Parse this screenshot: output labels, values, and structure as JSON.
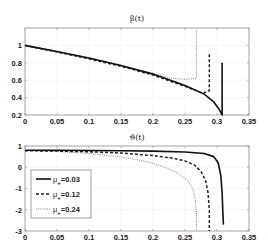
{
  "chart_data": [
    {
      "type": "line",
      "title": "β(t)",
      "xlabel": "",
      "ylabel": "",
      "xlim": [
        0,
        0.35
      ],
      "ylim": [
        0.2,
        1.2
      ],
      "xticks": [
        0,
        0.05,
        0.1,
        0.15,
        0.2,
        0.25,
        0.3,
        0.35
      ],
      "xtick_labels": [
        "0",
        "0.05",
        "0.1",
        "0.15",
        "0.2",
        "0.25",
        "0.3",
        "0.35"
      ],
      "yticks": [
        0.2,
        0.4,
        0.6,
        0.8,
        1
      ],
      "ytick_labels": [
        "0.2",
        "0.4",
        "0.6",
        "0.8",
        "1"
      ],
      "grid": true,
      "series": [
        {
          "name": "μ+=0.03",
          "style": "solid",
          "x": [
            0,
            0.05,
            0.1,
            0.15,
            0.2,
            0.25,
            0.28,
            0.295,
            0.303,
            0.308,
            0.308
          ],
          "y": [
            1.0,
            0.93,
            0.855,
            0.77,
            0.67,
            0.54,
            0.44,
            0.35,
            0.27,
            0.2,
            0.8
          ]
        },
        {
          "name": "μ+=0.12",
          "style": "dashed",
          "x": [
            0,
            0.05,
            0.1,
            0.15,
            0.2,
            0.25,
            0.278,
            0.288,
            0.288
          ],
          "y": [
            1.0,
            0.925,
            0.845,
            0.76,
            0.66,
            0.53,
            0.45,
            0.48,
            0.9
          ]
        },
        {
          "name": "μ+=0.24",
          "style": "dotted",
          "x": [
            0,
            0.05,
            0.1,
            0.15,
            0.2,
            0.23,
            0.25,
            0.268,
            0.268
          ],
          "y": [
            1.0,
            0.925,
            0.85,
            0.77,
            0.68,
            0.62,
            0.61,
            0.62,
            1.18
          ]
        }
      ]
    },
    {
      "type": "line",
      "title": "ϑ(t)",
      "xlabel": "",
      "ylabel": "",
      "xlim": [
        0,
        0.35
      ],
      "ylim": [
        -3,
        1
      ],
      "xticks": [
        0,
        0.05,
        0.1,
        0.15,
        0.2,
        0.25,
        0.3,
        0.35
      ],
      "xtick_labels": [
        "0",
        "0.05",
        "0.1",
        "0.15",
        "0.2",
        "0.25",
        "0.3",
        "0.35"
      ],
      "yticks": [
        -3,
        -2,
        -1,
        0,
        1
      ],
      "ytick_labels": [
        "-3",
        "-2",
        "-1",
        "0",
        "1"
      ],
      "grid": true,
      "legend": {
        "placement": "left",
        "entries": [
          {
            "symbol": "μ",
            "subscript": "+",
            "value": "=0.03",
            "style": "solid"
          },
          {
            "symbol": "μ",
            "subscript": "+",
            "value": "=0.12",
            "style": "dashed"
          },
          {
            "symbol": "μ",
            "subscript": "+",
            "value": "=0.24",
            "style": "dotted"
          }
        ]
      },
      "series": [
        {
          "name": "μ+=0.03",
          "style": "solid",
          "x": [
            0,
            0.05,
            0.1,
            0.15,
            0.2,
            0.25,
            0.28,
            0.295,
            0.302,
            0.306,
            0.308,
            0.309,
            0.31
          ],
          "y": [
            0.8,
            0.8,
            0.79,
            0.78,
            0.76,
            0.72,
            0.65,
            0.5,
            0.2,
            -0.4,
            -1.2,
            -2.0,
            -2.7
          ]
        },
        {
          "name": "μ+=0.12",
          "style": "dashed",
          "x": [
            0,
            0.05,
            0.1,
            0.15,
            0.2,
            0.23,
            0.25,
            0.265,
            0.275,
            0.282,
            0.286,
            0.288,
            0.288
          ],
          "y": [
            0.78,
            0.76,
            0.73,
            0.67,
            0.55,
            0.43,
            0.3,
            0.1,
            -0.2,
            -0.6,
            -1.2,
            -2.0,
            -3.0
          ]
        },
        {
          "name": "μ+=0.24",
          "style": "dotted",
          "x": [
            0,
            0.05,
            0.1,
            0.15,
            0.18,
            0.2,
            0.22,
            0.24,
            0.255,
            0.262,
            0.266,
            0.268,
            0.268
          ],
          "y": [
            0.78,
            0.74,
            0.65,
            0.48,
            0.33,
            0.18,
            -0.02,
            -0.3,
            -0.65,
            -1.0,
            -1.5,
            -2.2,
            -3.0
          ]
        }
      ]
    }
  ]
}
